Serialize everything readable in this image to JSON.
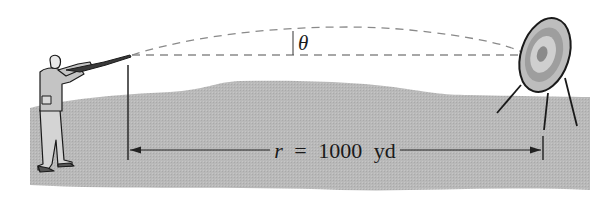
{
  "figure": {
    "angle_label": "θ",
    "range_label": {
      "variable": "r",
      "equals": "=",
      "value": "1000",
      "unit": "yd",
      "full": "r = 1000 yd"
    }
  },
  "colors": {
    "background": "#ffffff",
    "ground": "#b9b9b9",
    "ink": "#1a1a1a",
    "dashed": "#8a8a8a",
    "figure_fill": "#c8c8c8",
    "target_outer": "#bdbdbd",
    "target_ring": "#9a9a9a",
    "target_inner": "#d0d0d0",
    "target_center": "#8a8a8a"
  }
}
